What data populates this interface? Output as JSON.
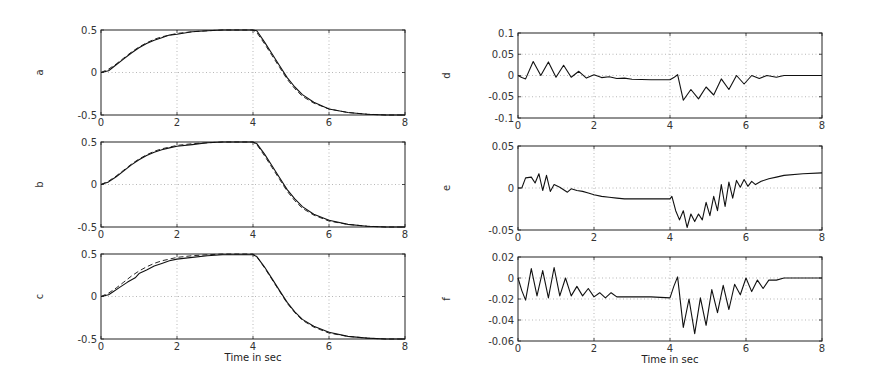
{
  "chart_data": [
    {
      "type": "line",
      "panel": "left-top",
      "ylabel": "a",
      "xlabel": "",
      "xlim": [
        0,
        8
      ],
      "ylim": [
        -0.5,
        0.5
      ],
      "xticks": [
        "0",
        "2",
        "4",
        "6",
        "8"
      ],
      "yticks": [
        "0.5",
        "0",
        "-0.5"
      ],
      "ytick_values": [
        0.5,
        0,
        -0.5
      ],
      "grid": true,
      "series": [
        {
          "name": "actual",
          "style": "solid",
          "x": [
            0,
            0.2,
            0.4,
            0.6,
            0.8,
            1.0,
            1.2,
            1.4,
            1.6,
            1.8,
            2.0,
            2.4,
            2.8,
            3.2,
            3.6,
            4.0,
            4.1,
            4.3,
            4.5,
            4.7,
            4.9,
            5.1,
            5.3,
            5.6,
            6.0,
            6.5,
            7.0,
            7.5,
            8.0
          ],
          "y": [
            0,
            0.02,
            0.09,
            0.16,
            0.23,
            0.29,
            0.34,
            0.38,
            0.41,
            0.44,
            0.45,
            0.48,
            0.49,
            0.5,
            0.5,
            0.5,
            0.49,
            0.36,
            0.22,
            0.08,
            -0.06,
            -0.17,
            -0.26,
            -0.35,
            -0.43,
            -0.47,
            -0.49,
            -0.5,
            -0.5
          ]
        },
        {
          "name": "reference",
          "style": "dashed",
          "x": [
            0,
            0.2,
            0.4,
            0.6,
            0.8,
            1.0,
            1.2,
            1.4,
            1.6,
            1.8,
            2.0,
            2.4,
            2.8,
            3.2,
            3.6,
            4.0,
            4.1,
            4.3,
            4.5,
            4.7,
            4.9,
            5.1,
            5.3,
            5.6,
            6.0,
            6.5,
            7.0,
            7.5,
            8.0
          ],
          "y": [
            0,
            0.04,
            0.1,
            0.17,
            0.24,
            0.3,
            0.35,
            0.39,
            0.42,
            0.44,
            0.46,
            0.48,
            0.49,
            0.5,
            0.5,
            0.5,
            0.47,
            0.34,
            0.2,
            0.06,
            -0.08,
            -0.19,
            -0.28,
            -0.36,
            -0.43,
            -0.47,
            -0.49,
            -0.5,
            -0.5
          ]
        }
      ]
    },
    {
      "type": "line",
      "panel": "left-middle",
      "ylabel": "b",
      "xlabel": "",
      "xlim": [
        0,
        8
      ],
      "ylim": [
        -0.5,
        0.5
      ],
      "xticks": [
        "0",
        "2",
        "4",
        "6",
        "8"
      ],
      "yticks": [
        "0.5",
        "0",
        "-0.5"
      ],
      "ytick_values": [
        0.5,
        0,
        -0.5
      ],
      "grid": true,
      "series": [
        {
          "name": "actual",
          "style": "solid",
          "x": [
            0,
            0.2,
            0.4,
            0.6,
            0.8,
            1.0,
            1.2,
            1.4,
            1.6,
            1.8,
            2.0,
            2.4,
            2.8,
            3.2,
            3.6,
            4.0,
            4.1,
            4.3,
            4.5,
            4.7,
            4.9,
            5.1,
            5.3,
            5.6,
            6.0,
            6.5,
            7.0,
            7.5,
            8.0
          ],
          "y": [
            0,
            0.03,
            0.09,
            0.16,
            0.23,
            0.29,
            0.34,
            0.38,
            0.41,
            0.43,
            0.45,
            0.47,
            0.49,
            0.5,
            0.5,
            0.5,
            0.48,
            0.36,
            0.22,
            0.08,
            -0.06,
            -0.17,
            -0.26,
            -0.35,
            -0.42,
            -0.47,
            -0.49,
            -0.5,
            -0.5
          ]
        },
        {
          "name": "reference",
          "style": "dashed",
          "x": [
            0,
            0.2,
            0.4,
            0.6,
            0.8,
            1.0,
            1.2,
            1.4,
            1.6,
            1.8,
            2.0,
            2.4,
            2.8,
            3.2,
            3.6,
            4.0,
            4.1,
            4.3,
            4.5,
            4.7,
            4.9,
            5.1,
            5.3,
            5.6,
            6.0,
            6.5,
            7.0,
            7.5,
            8.0
          ],
          "y": [
            0,
            0.04,
            0.1,
            0.17,
            0.24,
            0.3,
            0.35,
            0.39,
            0.42,
            0.44,
            0.46,
            0.48,
            0.49,
            0.5,
            0.5,
            0.5,
            0.47,
            0.34,
            0.2,
            0.06,
            -0.08,
            -0.19,
            -0.28,
            -0.36,
            -0.43,
            -0.47,
            -0.49,
            -0.5,
            -0.5
          ]
        }
      ]
    },
    {
      "type": "line",
      "panel": "left-bottom",
      "ylabel": "c",
      "xlabel": "Time in sec",
      "xlim": [
        0,
        8
      ],
      "ylim": [
        -0.5,
        0.5
      ],
      "xticks": [
        "0",
        "2",
        "4",
        "6",
        "8"
      ],
      "yticks": [
        "0.5",
        "0",
        "-0.5"
      ],
      "ytick_values": [
        0.5,
        0,
        -0.5
      ],
      "grid": true,
      "series": [
        {
          "name": "actual",
          "style": "solid",
          "x": [
            0,
            0.2,
            0.3,
            0.5,
            0.7,
            0.9,
            1.0,
            1.2,
            1.4,
            1.6,
            1.8,
            2.0,
            2.4,
            2.8,
            3.2,
            3.6,
            4.0,
            4.1,
            4.3,
            4.5,
            4.7,
            4.9,
            5.1,
            5.3,
            5.6,
            6.0,
            6.5,
            7.0,
            7.5,
            8.0
          ],
          "y": [
            0,
            0.02,
            0.05,
            0.11,
            0.17,
            0.22,
            0.27,
            0.31,
            0.36,
            0.39,
            0.42,
            0.44,
            0.46,
            0.48,
            0.49,
            0.49,
            0.49,
            0.47,
            0.35,
            0.21,
            0.07,
            -0.07,
            -0.18,
            -0.27,
            -0.35,
            -0.42,
            -0.47,
            -0.49,
            -0.5,
            -0.5
          ]
        },
        {
          "name": "reference",
          "style": "dashed",
          "x": [
            0,
            0.2,
            0.4,
            0.6,
            0.8,
            1.0,
            1.2,
            1.4,
            1.6,
            1.8,
            2.0,
            2.4,
            2.8,
            3.2,
            3.6,
            4.0,
            4.1,
            4.3,
            4.5,
            4.7,
            4.9,
            5.1,
            5.3,
            5.6,
            6.0,
            6.5,
            7.0,
            7.5,
            8.0
          ],
          "y": [
            0,
            0.04,
            0.1,
            0.17,
            0.24,
            0.3,
            0.35,
            0.39,
            0.42,
            0.44,
            0.46,
            0.48,
            0.49,
            0.5,
            0.5,
            0.5,
            0.47,
            0.34,
            0.2,
            0.06,
            -0.08,
            -0.19,
            -0.28,
            -0.36,
            -0.43,
            -0.47,
            -0.49,
            -0.5,
            -0.5
          ]
        }
      ]
    },
    {
      "type": "line",
      "panel": "right-top",
      "ylabel": "d",
      "xlabel": "",
      "xlim": [
        0,
        8
      ],
      "ylim": [
        -0.1,
        0.1
      ],
      "xticks": [
        "0",
        "2",
        "4",
        "6",
        "8"
      ],
      "yticks": [
        "0.1",
        "0.05",
        "0",
        "-0.05",
        "-0.1"
      ],
      "ytick_values": [
        0.1,
        0.05,
        0,
        -0.05,
        -0.1
      ],
      "grid": true,
      "series": [
        {
          "name": "error",
          "style": "solid",
          "x": [
            0,
            0.1,
            0.2,
            0.4,
            0.6,
            0.8,
            1.0,
            1.2,
            1.4,
            1.6,
            1.8,
            2.0,
            2.2,
            2.4,
            2.6,
            2.8,
            3.0,
            3.5,
            4.0,
            4.1,
            4.2,
            4.35,
            4.55,
            4.75,
            4.95,
            5.15,
            5.35,
            5.55,
            5.75,
            5.95,
            6.15,
            6.35,
            6.55,
            6.8,
            7.0,
            7.5,
            8.0
          ],
          "y": [
            0,
            -0.005,
            -0.008,
            0.033,
            0.0,
            0.032,
            -0.004,
            0.024,
            -0.004,
            0.01,
            -0.006,
            0.002,
            -0.005,
            -0.003,
            -0.007,
            -0.006,
            -0.009,
            -0.01,
            -0.01,
            -0.005,
            0.002,
            -0.058,
            -0.033,
            -0.055,
            -0.027,
            -0.046,
            -0.008,
            -0.033,
            0.0,
            -0.02,
            0.0,
            -0.007,
            0.0,
            -0.004,
            0.0,
            0.0,
            0.0
          ]
        }
      ]
    },
    {
      "type": "line",
      "panel": "right-middle",
      "ylabel": "e",
      "xlabel": "",
      "xlim": [
        0,
        8
      ],
      "ylim": [
        -0.05,
        0.05
      ],
      "xticks": [
        "0",
        "2",
        "4",
        "6",
        "8"
      ],
      "yticks": [
        "0.05",
        "0",
        "-0.05"
      ],
      "ytick_values": [
        0.05,
        0,
        -0.05
      ],
      "grid": true,
      "series": [
        {
          "name": "error",
          "style": "solid",
          "x": [
            0,
            0.1,
            0.2,
            0.35,
            0.45,
            0.55,
            0.65,
            0.75,
            0.85,
            0.95,
            1.1,
            1.3,
            1.4,
            1.55,
            1.7,
            1.85,
            2.0,
            2.2,
            2.4,
            2.6,
            2.8,
            3.0,
            3.5,
            4.0,
            4.05,
            4.15,
            4.25,
            4.35,
            4.45,
            4.55,
            4.65,
            4.75,
            4.85,
            4.95,
            5.05,
            5.15,
            5.25,
            5.35,
            5.45,
            5.55,
            5.65,
            5.75,
            5.85,
            5.95,
            6.05,
            6.15,
            6.25,
            6.4,
            6.6,
            6.8,
            7.0,
            7.5,
            8.0
          ],
          "y": [
            0,
            0.0,
            0.012,
            0.013,
            0.006,
            0.017,
            -0.003,
            0.015,
            -0.004,
            0.004,
            0.001,
            -0.005,
            -0.001,
            -0.003,
            -0.004,
            -0.006,
            -0.008,
            -0.01,
            -0.011,
            -0.012,
            -0.013,
            -0.013,
            -0.013,
            -0.013,
            -0.01,
            -0.027,
            -0.038,
            -0.027,
            -0.047,
            -0.031,
            -0.04,
            -0.031,
            -0.038,
            -0.017,
            -0.033,
            -0.01,
            -0.027,
            0.004,
            -0.022,
            0.007,
            -0.012,
            0.009,
            0.001,
            0.01,
            0.002,
            0.008,
            0.004,
            0.008,
            0.011,
            0.013,
            0.015,
            0.017,
            0.018
          ]
        }
      ]
    },
    {
      "type": "line",
      "panel": "right-bottom",
      "ylabel": "f",
      "xlabel": "Time in sec",
      "xlim": [
        0,
        8
      ],
      "ylim": [
        -0.06,
        0.02
      ],
      "xticks": [
        "0",
        "2",
        "4",
        "6",
        "8"
      ],
      "yticks": [
        "0.02",
        "0",
        "-0.02",
        "-0.04",
        "-0.06"
      ],
      "ytick_values": [
        0.02,
        0,
        -0.02,
        -0.04,
        -0.06
      ],
      "grid": true,
      "series": [
        {
          "name": "error",
          "style": "solid",
          "x": [
            0,
            0.1,
            0.2,
            0.35,
            0.5,
            0.65,
            0.8,
            0.95,
            1.1,
            1.25,
            1.4,
            1.55,
            1.7,
            1.85,
            2.0,
            2.15,
            2.3,
            2.45,
            2.6,
            3.0,
            3.5,
            4.0,
            4.1,
            4.2,
            4.35,
            4.5,
            4.65,
            4.8,
            4.95,
            5.1,
            5.25,
            5.4,
            5.55,
            5.7,
            5.85,
            6.0,
            6.15,
            6.3,
            6.45,
            6.6,
            6.8,
            7.0,
            7.5,
            8.0
          ],
          "y": [
            0,
            -0.012,
            -0.021,
            0.009,
            -0.017,
            0.007,
            -0.019,
            0.01,
            -0.017,
            0.0,
            -0.017,
            -0.008,
            -0.017,
            -0.01,
            -0.018,
            -0.014,
            -0.019,
            -0.014,
            -0.018,
            -0.018,
            -0.018,
            -0.019,
            -0.008,
            0.001,
            -0.047,
            -0.02,
            -0.053,
            -0.019,
            -0.045,
            -0.011,
            -0.033,
            -0.007,
            -0.03,
            -0.006,
            -0.016,
            0.0,
            -0.013,
            -0.002,
            -0.01,
            -0.002,
            -0.002,
            0.0,
            0.0,
            0.0
          ]
        }
      ]
    }
  ],
  "layout": {
    "panels": [
      {
        "x": 101,
        "y": 30,
        "w": 304,
        "h": 85
      },
      {
        "x": 101,
        "y": 142,
        "w": 304,
        "h": 85
      },
      {
        "x": 101,
        "y": 254,
        "w": 304,
        "h": 85
      },
      {
        "x": 518,
        "y": 33,
        "w": 304,
        "h": 85
      },
      {
        "x": 518,
        "y": 146,
        "w": 304,
        "h": 84
      },
      {
        "x": 518,
        "y": 257,
        "w": 304,
        "h": 84
      }
    ]
  },
  "colors": {
    "line": "#111111",
    "frame": "#222222",
    "grid": "#9a9a9a",
    "text": "#333333"
  }
}
